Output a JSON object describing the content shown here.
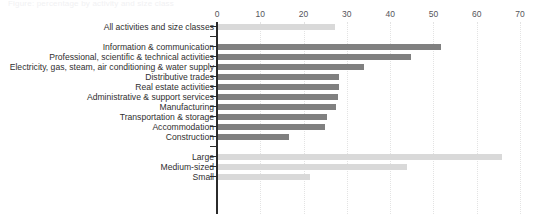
{
  "title": {
    "text": "Figure: percentage by activity and size class",
    "visible_faded": true
  },
  "axis": {
    "ticks": [
      "0",
      "10",
      "20",
      "30",
      "40",
      "50",
      "60",
      "70"
    ],
    "tick_values": [
      0,
      10,
      20,
      30,
      40,
      50,
      60,
      70
    ],
    "xlim_min": 0,
    "xlim_max": 70
  },
  "colors": {
    "bar_dark": "#808080",
    "bar_light": "#d9d9d9",
    "axis": "#2b2b2b",
    "gridline": "#e3e3e3",
    "label_text": "#2f2f2f",
    "tick_text": "#55555a",
    "background": "#ffffff"
  },
  "rows": [
    {
      "label": "All activities and size classes",
      "value": 27.0,
      "style": "light",
      "group": "total"
    },
    {
      "label": "",
      "value": null,
      "style": "spacer",
      "group": "gap"
    },
    {
      "label": "Information & communication",
      "value": 51.5,
      "style": "dark",
      "group": "activity"
    },
    {
      "label": "Professional, scientific & technical activities",
      "value": 44.5,
      "style": "dark",
      "group": "activity"
    },
    {
      "label": "Electricity, gas, steam, air conditioning & water supply",
      "value": 33.7,
      "style": "dark",
      "group": "activity"
    },
    {
      "label": "Distributive trades",
      "value": 27.9,
      "style": "dark",
      "group": "activity"
    },
    {
      "label": "Real estate activities",
      "value": 27.9,
      "style": "dark",
      "group": "activity"
    },
    {
      "label": "Administrative & support services",
      "value": 27.7,
      "style": "dark",
      "group": "activity"
    },
    {
      "label": "Manufacturing",
      "value": 27.2,
      "style": "dark",
      "group": "activity"
    },
    {
      "label": "Transportation & storage",
      "value": 25.2,
      "style": "dark",
      "group": "activity"
    },
    {
      "label": "Accommodation",
      "value": 24.7,
      "style": "dark",
      "group": "activity"
    },
    {
      "label": "Construction",
      "value": 16.4,
      "style": "dark",
      "group": "activity"
    },
    {
      "label": "",
      "value": null,
      "style": "spacer",
      "group": "gap"
    },
    {
      "label": "Large",
      "value": 65.6,
      "style": "light",
      "group": "size"
    },
    {
      "label": "Medium-sized",
      "value": 43.6,
      "style": "light",
      "group": "size"
    },
    {
      "label": "Small",
      "value": 21.2,
      "style": "light",
      "group": "size"
    }
  ],
  "chart_data": {
    "type": "bar",
    "orientation": "horizontal",
    "title": "Figure: percentage by activity and size class",
    "xlabel": "",
    "ylabel": "",
    "xlim": [
      0,
      70
    ],
    "grid": true,
    "grid_axis": "x",
    "legend": null,
    "categories": [
      "All activities and size classes",
      "Information & communication",
      "Professional, scientific & technical activities",
      "Electricity, gas, steam, air conditioning & water supply",
      "Distributive trades",
      "Real estate activities",
      "Administrative & support services",
      "Manufacturing",
      "Transportation & storage",
      "Accommodation",
      "Construction",
      "Large",
      "Medium-sized",
      "Small"
    ],
    "values": [
      27.0,
      51.5,
      44.5,
      33.7,
      27.9,
      27.9,
      27.7,
      27.2,
      25.2,
      24.7,
      16.4,
      65.6,
      43.6,
      21.2
    ],
    "tick_labels": [
      "0",
      "10",
      "20",
      "30",
      "40",
      "50",
      "60",
      "70"
    ],
    "groups": [
      {
        "name": "All activities and size classes",
        "color": "#d9d9d9",
        "categories": [
          "All activities and size classes"
        ]
      },
      {
        "name": "Economic activity",
        "color": "#808080",
        "categories": [
          "Information & communication",
          "Professional, scientific & technical activities",
          "Electricity, gas, steam, air conditioning & water supply",
          "Distributive trades",
          "Real estate activities",
          "Administrative & support services",
          "Manufacturing",
          "Transportation & storage",
          "Accommodation",
          "Construction"
        ]
      },
      {
        "name": "Size class",
        "color": "#d9d9d9",
        "categories": [
          "Large",
          "Medium-sized",
          "Small"
        ]
      }
    ]
  }
}
